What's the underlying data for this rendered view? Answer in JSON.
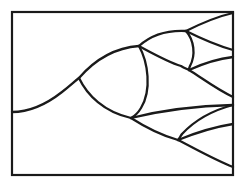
{
  "figure": {
    "canvas": {
      "width": 248,
      "height": 186
    },
    "colors": {
      "background": "#ffffff",
      "stroke": "#1a1a1a",
      "frame": "#1a1a1a"
    },
    "stroke_width": 2.3,
    "frame": {
      "x": 12,
      "y": 12,
      "width": 221,
      "height": 163
    },
    "nodes": [
      {
        "id": "root",
        "label": "root-origin",
        "x": 12,
        "y": 112
      },
      {
        "id": "n1",
        "label": "first-fork",
        "x": 79,
        "y": 78
      },
      {
        "id": "n2",
        "label": "upper-fork",
        "x": 139,
        "y": 46
      },
      {
        "id": "n3",
        "label": "lower-fork",
        "x": 131,
        "y": 118
      },
      {
        "id": "n4",
        "label": "upper-upper-fork",
        "x": 186,
        "y": 31
      },
      {
        "id": "n5",
        "label": "upper-lower-fork",
        "x": 189,
        "y": 70
      },
      {
        "id": "n6",
        "label": "lower-lower-fork",
        "x": 178,
        "y": 140
      }
    ],
    "tip_terminations": [
      {
        "id": "t1",
        "label": "tip-1",
        "x": 233,
        "y": 13
      },
      {
        "id": "t2",
        "label": "tip-2",
        "x": 233,
        "y": 50
      },
      {
        "id": "t3",
        "label": "tip-3",
        "x": 233,
        "y": 57
      },
      {
        "id": "t4",
        "label": "tip-4",
        "x": 233,
        "y": 97
      },
      {
        "id": "t5",
        "label": "tip-5",
        "x": 233,
        "y": 105
      },
      {
        "id": "t6",
        "label": "tip-6",
        "x": 233,
        "y": 124
      },
      {
        "id": "t7",
        "label": "tip-7",
        "x": 233,
        "y": 167
      }
    ],
    "paths": {
      "stem": "M 12,112 C 30,112 48,103 62,92 C 70,86 75,81 79,78",
      "lens_main_upper": "M 79,78 C 92,63 112,48 139,46",
      "lens_main_lower": "M 79,78 C 87,95 104,112 131,118",
      "lens_main_close": "M 139,46 C 148,62 152,90 141,108 C 138,113 135,116 131,118",
      "lens_u_upper": "M 139,46 C 150,36 166,30 186,31",
      "lens_u_lower": "M 139,46 C 152,53 168,62 181,66 C 184,68 187,69 189,70",
      "lens_u_close": "M 186,31 C 194,40 196,55 190,66 C 189,68 189,69 189,70",
      "tip_uu_upper": "M 186,31 C 200,24 215,17 233,13",
      "tip_uu_lower": "M 186,31 C 200,38 215,45 233,50",
      "tip_ul_upper": "M 189,70 C 202,64 216,59 233,57",
      "tip_ul_lower": "M 189,70 C 202,78 216,89 233,97",
      "tip_l_upper": "M 131,118 C 155,112 192,106 233,105",
      "lens_l_lower": "M 131,118 C 145,127 160,135 178,140",
      "lens_l_close": "M 233,105 C 214,110 195,120 182,134 C 180,137 179,139 178,140",
      "tip_ll_upper": "M 178,140 C 195,133 214,127 233,124",
      "tip_ll_lower": "M 178,140 C 194,148 213,159 233,167"
    }
  }
}
